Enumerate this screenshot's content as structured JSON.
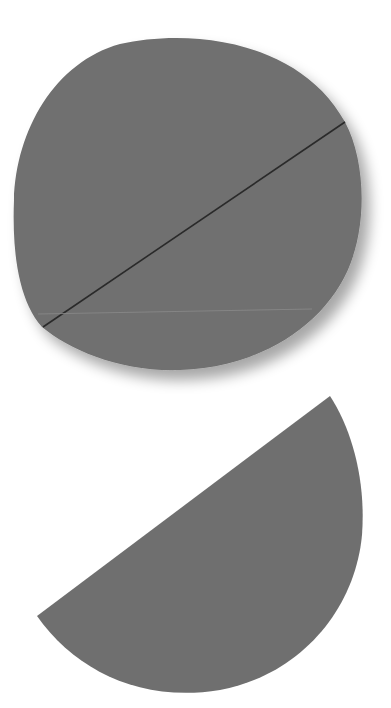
{
  "scene": {
    "description": "Two gray paper cutouts on white background: a full disc with a dark diagonal fold/cut line, and a separated half-disc below",
    "background_color": "#ffffff",
    "shape_color": "#6e6e6e",
    "line_color": "#2a2a2a",
    "shapes": [
      {
        "name": "full-disc",
        "center": [
          188,
          203
        ],
        "radius": [
          175,
          167
        ]
      },
      {
        "name": "half-disc",
        "chord_start": [
          37,
          616
        ],
        "chord_end": [
          330,
          396
        ]
      }
    ]
  }
}
